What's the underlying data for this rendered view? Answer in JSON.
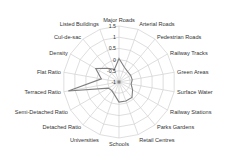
{
  "chart_data": {
    "type": "radar",
    "title": "",
    "axes": [
      "Major Roads",
      "Arterial Roads",
      "Pedestrian Roads",
      "Railway Tracks",
      "Green Areas",
      "Surface Water",
      "Railway Stations",
      "Parks Gardens",
      "Retail Centres",
      "Schools",
      "Universities",
      "Detached Ratio",
      "Semi-Detached Ratio",
      "Terraced Ratio",
      "Flat Ratio",
      "Density",
      "Cul-de-sac",
      "Listed Buildings"
    ],
    "series": [
      {
        "name": "",
        "color": "#7f7f7f",
        "values": [
          0.05,
          -0.3,
          -0.4,
          -0.4,
          -0.4,
          -0.45,
          -0.3,
          -0.1,
          -0.1,
          -0.1,
          -0.4,
          -0.5,
          -0.45,
          1.3,
          -0.2,
          0.2,
          -0.2,
          -0.4
        ]
      }
    ],
    "rlim": [
      -1,
      1.5
    ],
    "ticks": [
      -1,
      -0.5,
      0,
      0.5,
      1,
      1.5
    ],
    "tick_labels": [
      "-1",
      "-0.5",
      "0",
      "0.5",
      "1",
      "1.5"
    ],
    "grid": true,
    "legend": "none"
  },
  "colors": {
    "grid": "#d0d0d0",
    "series": "#7f7f7f",
    "text": "#333333"
  }
}
